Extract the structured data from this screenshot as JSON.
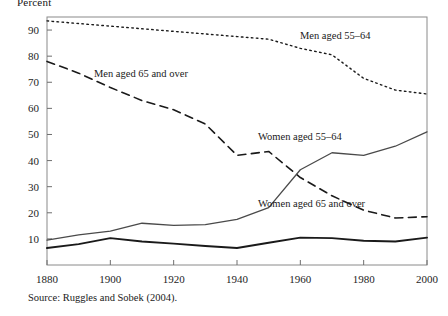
{
  "figure": {
    "axis_title": "Percent",
    "source_note": "Source: Ruggles and Sobek (2004).",
    "background": "#ffffff",
    "ink": "#1a1a1a"
  },
  "chart_data": {
    "type": "line",
    "title": "",
    "subtitle": "",
    "xlabel": "",
    "ylabel": "Percent",
    "xlim": [
      1880,
      2000
    ],
    "ylim": [
      0,
      95
    ],
    "grid": false,
    "legend_position": "inline-annotations",
    "xticks": [
      1880,
      1900,
      1920,
      1940,
      1960,
      1980,
      2000
    ],
    "xtick_labels": [
      "1880",
      "1900",
      "1920",
      "1940",
      "1960",
      "1980",
      "2000"
    ],
    "yticks": [
      10,
      20,
      30,
      40,
      50,
      60,
      70,
      80,
      90
    ],
    "ytick_labels": [
      "10",
      "20",
      "30",
      "40",
      "50",
      "60",
      "70",
      "80",
      "90"
    ],
    "x": [
      1880,
      1890,
      1900,
      1910,
      1920,
      1930,
      1940,
      1950,
      1960,
      1970,
      1980,
      1990,
      2000
    ],
    "series": [
      {
        "name": "Men aged 55-64",
        "label": "Men aged 55–64",
        "style": "dotted",
        "color": "#1a1a1a",
        "width": 1.4,
        "label_x": 300,
        "label_y": 39,
        "values": [
          93.5,
          92.5,
          91.5,
          90.5,
          89.5,
          88.5,
          87.5,
          86.5,
          83.0,
          80.5,
          71.5,
          67.0,
          65.5
        ]
      },
      {
        "name": "Men aged 65 and over",
        "label": "Men aged 65 and over",
        "style": "dashed",
        "color": "#1a1a1a",
        "width": 1.6,
        "label_x": 94,
        "label_y": 77,
        "values": [
          78.0,
          73.5,
          68.0,
          63.0,
          59.5,
          54.0,
          42.0,
          43.5,
          33.5,
          26.5,
          21.0,
          18.0,
          18.5
        ]
      },
      {
        "name": "Women aged 55-64",
        "label": "Women aged 55–64",
        "style": "solid",
        "color": "#4a4a4a",
        "width": 1.3,
        "label_x": 258,
        "label_y": 140,
        "values": [
          9.5,
          11.5,
          13.0,
          16.0,
          15.2,
          15.5,
          17.5,
          22.0,
          36.5,
          43.0,
          42.0,
          45.5,
          51.0
        ]
      },
      {
        "name": "Women aged 65 and over",
        "label": "Women aged 65 and over",
        "style": "solid",
        "color": "#1a1a1a",
        "width": 1.9,
        "label_x": 258,
        "label_y": 207,
        "values": [
          6.5,
          8.0,
          10.3,
          9.0,
          8.2,
          7.3,
          6.5,
          8.5,
          10.5,
          10.3,
          9.3,
          9.0,
          10.5
        ]
      }
    ]
  }
}
